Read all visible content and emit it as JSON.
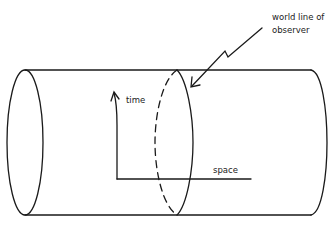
{
  "diagram": {
    "labels": {
      "world_line_line1": "world line of",
      "world_line_line2": "observer",
      "time": "time",
      "space": "space"
    },
    "colors": {
      "stroke": "#1a1a1a",
      "background": "#ffffff",
      "text": "#222222"
    },
    "elements": [
      "cylinder (spacetime with closed spatial dimension)",
      "left end ellipse",
      "middle ellipse (dashed back, solid front) = world line of observer",
      "right end arc",
      "time axis arrow (vertical, curved)",
      "space axis (horizontal)",
      "zigzag callout arrow"
    ]
  }
}
